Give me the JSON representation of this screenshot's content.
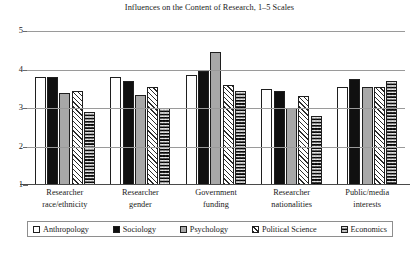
{
  "chart_data": {
    "type": "bar",
    "title": "Influences on the Content of Research, 1–5 Scales",
    "xlabel": "",
    "ylabel": "",
    "ylim": [
      1,
      5
    ],
    "yticks": [
      1,
      2,
      3,
      4,
      5
    ],
    "ytick_labels": [
      "1",
      "2",
      "3",
      "4",
      "5"
    ],
    "grid": true,
    "legend_position": "bottom",
    "categories": [
      "Researcher race/ethnicity",
      "Researcher gender",
      "Government funding",
      "Researcher nationalities",
      "Public/media interests"
    ],
    "category_lines": [
      [
        "Researcher",
        "race/ethnicity"
      ],
      [
        "Researcher",
        "gender"
      ],
      [
        "Government",
        "funding"
      ],
      [
        "Researcher",
        "nationalities"
      ],
      [
        "Public/media",
        "interests"
      ]
    ],
    "series": [
      {
        "name": "Anthropology",
        "pattern": "dotted-white",
        "values": [
          3.8,
          3.8,
          3.85,
          3.5,
          3.55
        ]
      },
      {
        "name": "Sociology",
        "pattern": "solid-black",
        "values": [
          3.8,
          3.7,
          3.95,
          3.45,
          3.75
        ]
      },
      {
        "name": "Psychology",
        "pattern": "solid-grey",
        "values": [
          3.4,
          3.35,
          4.45,
          3.0,
          3.55
        ]
      },
      {
        "name": "Political Science",
        "pattern": "diagonal-hatch",
        "values": [
          3.45,
          3.55,
          3.6,
          3.3,
          3.55
        ]
      },
      {
        "name": "Economics",
        "pattern": "checkerboard",
        "values": [
          2.9,
          3.0,
          3.45,
          2.8,
          3.7
        ]
      }
    ]
  },
  "legend": {
    "items": [
      {
        "label": "Anthropology"
      },
      {
        "label": "Sociology"
      },
      {
        "label": "Psychology"
      },
      {
        "label": "Political Science"
      },
      {
        "label": "Economics"
      }
    ]
  },
  "colors": {
    "background": "#ffffff",
    "text": "#1a1a1a",
    "gridline": "#9a9a9a",
    "axis": "#4a4a4a",
    "series_anthropology": "#ffffff",
    "series_sociology": "#101010",
    "series_psychology": "#a8a8a8",
    "series_political_science": "#ffffff",
    "series_economics": "#ffffff"
  }
}
